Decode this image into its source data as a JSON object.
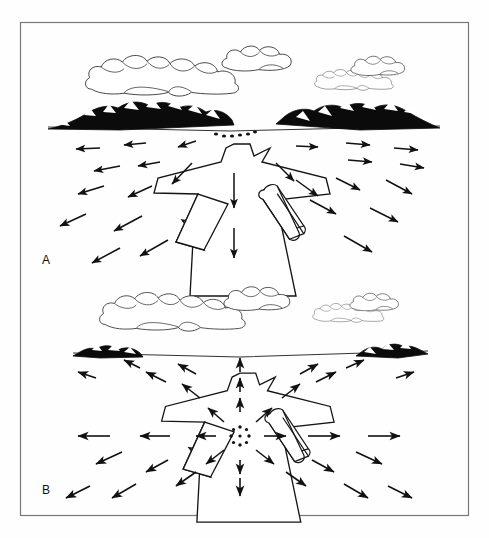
{
  "figure": {
    "background_color": "#fefefe",
    "ink_color": "#111111",
    "border_color": "#666666",
    "frame": {
      "x": 20,
      "y": 22,
      "width": 449,
      "height": 494
    }
  },
  "panels": [
    {
      "id": "A",
      "label": "A",
      "label_position": {
        "x": 42,
        "y": 264
      },
      "caption_hint": "Microburst aloft descending toward the airport; outflow not yet at the surface",
      "horizon_y": 128,
      "sky": {
        "clouds": [
          {
            "name": "cloud-bank-left",
            "cx": 170,
            "cy": 76,
            "scale": 1.0
          },
          {
            "name": "cloud-small-upper",
            "cx": 258,
            "cy": 62,
            "scale": 0.45
          },
          {
            "name": "cloud-bank-right",
            "cx": 350,
            "cy": 80,
            "scale": 0.52
          },
          {
            "name": "cloud-small-right",
            "cx": 382,
            "cy": 68,
            "scale": 0.4
          }
        ]
      },
      "terrain": {
        "mountain_left": {
          "x": 48,
          "width": 178,
          "height": 22
        },
        "mountain_right": {
          "x": 268,
          "width": 172,
          "height": 22
        }
      },
      "burst_marker": {
        "name": "descending-microburst-dots",
        "style": "arc-of-dots",
        "cx": 230,
        "cy": 131,
        "dots": 6
      },
      "wind_arrows_note": "Arrows sweep outward and downward, fanning left and right away from the runway centerline; longer near the foreground.",
      "arrow_count": 22
    },
    {
      "id": "B",
      "label": "B",
      "label_position": {
        "x": 42,
        "y": 494
      },
      "caption_hint": "Microburst has touched down on the airport; outflow diverges radially in all directions",
      "horizon_y": 354,
      "sky": {
        "clouds": [
          {
            "name": "cloud-bank-left",
            "cx": 183,
            "cy": 310,
            "scale": 0.92
          },
          {
            "name": "cloud-small-upper",
            "cx": 258,
            "cy": 300,
            "scale": 0.42
          },
          {
            "name": "cloud-bank-right",
            "cx": 348,
            "cy": 310,
            "scale": 0.46
          },
          {
            "name": "cloud-small-right",
            "cx": 378,
            "cy": 302,
            "scale": 0.36
          }
        ]
      },
      "terrain": {
        "mountain_left": {
          "x": 72,
          "width": 62,
          "height": 10
        },
        "mountain_right": {
          "x": 368,
          "width": 62,
          "height": 10
        }
      },
      "burst_marker": {
        "name": "surface-microburst-starburst",
        "style": "radial-dot-starburst",
        "cx": 240,
        "cy": 436,
        "dots": 8
      },
      "wind_arrows_note": "Arrows radiate symmetrically outward from the touchdown point in every direction, including straight up toward the horizon and straight down toward the viewer.",
      "arrow_count": 34
    }
  ],
  "airport": {
    "name": "runway-complex",
    "description": "Perspective plan view of intersecting runways forming an arrow/cross shape",
    "hangar": {
      "name": "terminal-hangar",
      "shape": "rounded-3d-block"
    }
  },
  "legend_note": "No legend, axis, or numeric labels appear in the figure."
}
